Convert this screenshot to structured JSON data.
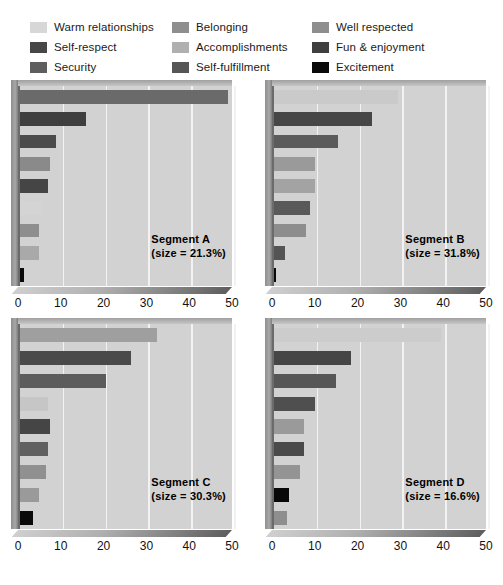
{
  "legend": {
    "columns": [
      [
        {
          "label": "Warm relationships",
          "color": "#d7d7d7"
        },
        {
          "label": "Self-respect",
          "color": "#474747"
        },
        {
          "label": "Security",
          "color": "#5e5e5e"
        }
      ],
      [
        {
          "label": "Belonging",
          "color": "#8e8e8e"
        },
        {
          "label": "Accomplishments",
          "color": "#b0b0b0"
        },
        {
          "label": "Self-fulfillment",
          "color": "#565656"
        }
      ],
      [
        {
          "label": "Well respected",
          "color": "#8e8e8e"
        },
        {
          "label": "Fun & enjoyment",
          "color": "#3f3f3f"
        },
        {
          "label": "Excitement",
          "color": "#0a0a0a"
        }
      ]
    ]
  },
  "axis": {
    "ticks": [
      0,
      10,
      20,
      30,
      40,
      50
    ],
    "min": 0,
    "max": 50
  },
  "chart_data": [
    {
      "type": "bar",
      "title": "Segment A",
      "subtitle": "(size = 21.3%)",
      "orientation": "horizontal",
      "xlabel": "",
      "ylabel": "",
      "xlim": [
        0,
        50
      ],
      "grid": true,
      "categories": [
        "Self-fulfillment",
        "Self-respect",
        "Fun & enjoyment",
        "Belonging",
        "Security",
        "Warm relationships",
        "Well respected",
        "Accomplishments",
        "Excitement"
      ],
      "values": [
        48.5,
        15.5,
        8.5,
        7.0,
        6.5,
        5.0,
        4.5,
        4.5,
        1.0
      ],
      "colors": [
        "#6a6a6a",
        "#3f3f3f",
        "#4b4b4b",
        "#8a8a8a",
        "#454545",
        "#d4d4d4",
        "#8e8e8e",
        "#a9a9a9",
        "#0a0a0a"
      ]
    },
    {
      "type": "bar",
      "title": "Segment B",
      "subtitle": "(size = 31.8%)",
      "orientation": "horizontal",
      "xlabel": "",
      "ylabel": "",
      "xlim": [
        0,
        50
      ],
      "grid": true,
      "categories": [
        "Warm relationships",
        "Self-respect",
        "Security",
        "Belonging",
        "Accomplishments",
        "Self-fulfillment",
        "Well respected",
        "Fun & enjoyment",
        "Excitement"
      ],
      "values": [
        29.0,
        23.0,
        15.0,
        9.5,
        9.5,
        8.5,
        7.5,
        2.5,
        0.5
      ],
      "colors": [
        "#cacaca",
        "#464646",
        "#5b5b5b",
        "#9a9a9a",
        "#a3a3a3",
        "#595959",
        "#8d8d8d",
        "#545454",
        "#0a0a0a"
      ]
    },
    {
      "type": "bar",
      "title": "Segment C",
      "subtitle": "(size = 30.3%)",
      "orientation": "horizontal",
      "xlabel": "",
      "ylabel": "",
      "xlim": [
        0,
        50
      ],
      "grid": true,
      "categories": [
        "Warm relationships",
        "Self-respect",
        "Security",
        "Accomplishments",
        "Self-fulfillment",
        "Belonging",
        "Well respected",
        "Fun & enjoyment",
        "Excitement"
      ],
      "values": [
        32.0,
        26.0,
        20.0,
        6.5,
        7.0,
        6.5,
        6.0,
        4.5,
        3.0
      ],
      "colors": [
        "#9f9f9f",
        "#4a4a4a",
        "#5c5c5c",
        "#c6c6c6",
        "#454545",
        "#606060",
        "#909090",
        "#9a9a9a",
        "#0a0a0a"
      ]
    },
    {
      "type": "bar",
      "title": "Segment D",
      "subtitle": "(size = 16.6%)",
      "orientation": "horizontal",
      "xlabel": "",
      "ylabel": "",
      "xlim": [
        0,
        50
      ],
      "grid": true,
      "categories": [
        "Warm relationships",
        "Self-respect",
        "Security",
        "Self-fulfillment",
        "Belonging",
        "Fun & enjoyment",
        "Well respected",
        "Excitement",
        "Accomplishments"
      ],
      "values": [
        39.0,
        18.0,
        14.5,
        9.5,
        7.0,
        7.0,
        6.0,
        3.5,
        3.0
      ],
      "colors": [
        "#cccccc",
        "#464646",
        "#565656",
        "#4f4f4f",
        "#9a9a9a",
        "#4a4a4a",
        "#949494",
        "#080808",
        "#8e8e8e"
      ]
    }
  ]
}
